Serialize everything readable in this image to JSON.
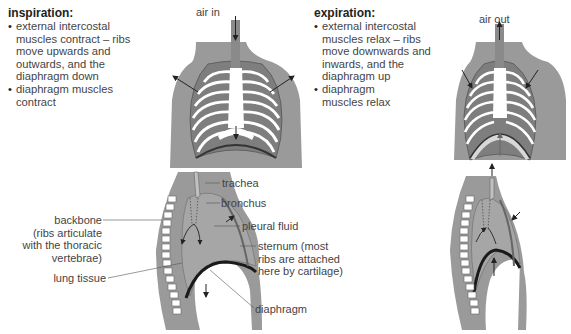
{
  "inspiration": {
    "heading": "inspiration:",
    "bullets": [
      "external intercostal muscles contract – ribs move upwards and outwards, and the diaphragm down",
      "diaphragm muscles contract"
    ],
    "bullet_lines": [
      [
        "external intercostal",
        "muscles contract – ribs",
        "move upwards and",
        "outwards, and the",
        "diaphragm down"
      ],
      [
        "diaphragm muscles",
        "contract"
      ]
    ],
    "air_label": "air in"
  },
  "expiration": {
    "heading": "expiration:",
    "bullets": [
      "external intercostal muscles relax – ribs move downwards and inwards, and the diaphragm up",
      "diaphragm muscles relax"
    ],
    "bullet_lines": [
      [
        "external intercostal",
        "muscles relax – ribs",
        "move downwards and",
        "inwards, and the",
        "diaphragm up"
      ],
      [
        "diaphragm",
        "muscles relax"
      ]
    ],
    "air_label": "air out"
  },
  "side_view_labels": {
    "trachea": "trachea",
    "bronchus": "bronchus",
    "pleural_fluid": "pleural fluid",
    "sternum": [
      "sternum (most",
      "ribs are attached",
      "here by cartilage)"
    ],
    "backbone": [
      "backbone",
      "(ribs articulate",
      "with the thoracic",
      "vertebrae)"
    ],
    "lung_tissue": "lung tissue",
    "diaphragm": "diaphragm"
  },
  "colors": {
    "body_grey": "#9a9a9a",
    "lung_grey": "#a6a6a6",
    "rib_dark": "#7a7a7a",
    "bone_white": "#ffffff",
    "diaphragm_black": "#1a1a1a",
    "line": "#555555"
  }
}
